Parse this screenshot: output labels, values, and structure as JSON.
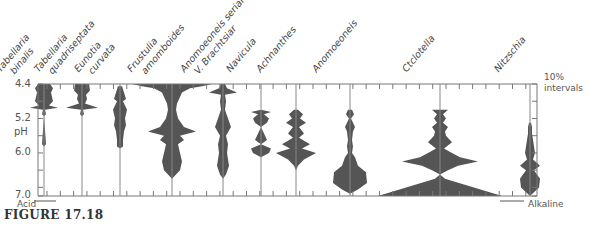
{
  "caption": "FIGURE 17.18",
  "direction": {
    "left": "Acid",
    "right": "Alkaline"
  },
  "interval_note": [
    "10%",
    "intervals"
  ],
  "y_axis": {
    "label": "pH",
    "ticks": [
      "4.4",
      "5.2",
      "6.0",
      "7.0"
    ]
  },
  "species_labels": [
    [
      "Tabellaria",
      "binalis"
    ],
    [
      "Tabellaria",
      "quadriseptata"
    ],
    [
      "Eunotia",
      "curvata"
    ],
    [
      "Frustulia",
      "amomboides"
    ],
    [
      "Anomoeoneis serians",
      "V. Brachtsiar"
    ],
    [
      "Navicula"
    ],
    [
      "Achnanthes"
    ],
    [
      "Anomoeoneis"
    ],
    [
      "Ctclotella"
    ],
    [
      "Nitzschia"
    ]
  ],
  "chart_data": {
    "type": "area",
    "title": "FIGURE 17.18",
    "xlabel": "Acid → Alkaline",
    "ylabel": "pH",
    "ylim": [
      4.4,
      7.0
    ],
    "y_ticks": [
      4.4,
      5.2,
      6.0,
      7.0
    ],
    "scale_note": "10% intervals",
    "series": [
      {
        "name": "Tabellaria binalis",
        "peak_pH": 4.6,
        "range": [
          4.4,
          6.3
        ]
      },
      {
        "name": "Tabellaria quadriseptata",
        "peak_pH": 4.5,
        "range": [
          4.4,
          5.3
        ]
      },
      {
        "name": "Eunotia curvata",
        "peak_pH": 5.0,
        "range": [
          4.5,
          5.9
        ]
      },
      {
        "name": "Frustulia amomboides",
        "peak_pH": 4.5,
        "range": [
          4.4,
          6.6
        ]
      },
      {
        "name": "Anomoeoneis serians V. Brachtsiar",
        "peak_pH": 4.6,
        "range": [
          4.4,
          6.6
        ]
      },
      {
        "name": "Navicula",
        "peak_pH": 6.0,
        "range": [
          5.0,
          6.1
        ]
      },
      {
        "name": "Achnanthes",
        "peak_pH": 6.0,
        "range": [
          5.0,
          6.4
        ]
      },
      {
        "name": "Anomoeoneis",
        "peak_pH": 6.7,
        "range": [
          5.0,
          7.0
        ]
      },
      {
        "name": "Ctclotella",
        "peak_pH": 7.0,
        "range": [
          5.0,
          7.0
        ]
      },
      {
        "name": "Nitzschia",
        "peak_pH": 6.9,
        "range": [
          5.3,
          7.0
        ]
      }
    ]
  }
}
